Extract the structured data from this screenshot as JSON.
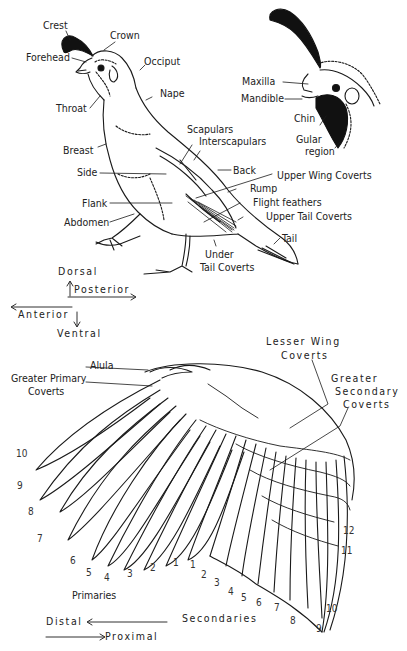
{
  "diagram": {
    "body_labels": {
      "crest": "Crest",
      "crown": "Crown",
      "forehead": "Forehead",
      "occiput": "Occiput",
      "throat": "Throat",
      "nape": "Nape",
      "breast": "Breast",
      "scapulars": "Scapulars",
      "interscapulars": "Interscapulars",
      "side": "Side",
      "back": "Back",
      "upper_wing_coverts": "Upper Wing Coverts",
      "rump": "Rump",
      "flank": "Flank",
      "flight_feathers": "Flight feathers",
      "upper_tail_coverts": "Upper Tail Coverts",
      "abdomen": "Abdomen",
      "tail": "Tail",
      "under_tail_coverts_1": "Under",
      "under_tail_coverts_2": "Tail Coverts"
    },
    "head_labels": {
      "maxilla": "Maxilla",
      "mandible": "Mandible",
      "chin": "Chin",
      "gular_1": "Gular",
      "gular_2": "region"
    },
    "orientation_body": {
      "dorsal": "Dorsal",
      "posterior": "Posterior",
      "anterior": "Anterior",
      "ventral": "Ventral"
    },
    "wing_labels": {
      "alula": "Alula",
      "greater_primary_coverts_1": "Greater Primary",
      "greater_primary_coverts_2": "Coverts",
      "lesser_wing_coverts_1": "Lesser Wing",
      "lesser_wing_coverts_2": "Coverts",
      "greater_secondary_coverts_1": "Greater",
      "greater_secondary_coverts_2": "Secondary",
      "greater_secondary_coverts_3": "Coverts",
      "primaries": "Primaries",
      "secondaries": "Secondaries"
    },
    "primary_numbers": [
      "10",
      "9",
      "8",
      "7",
      "6",
      "5",
      "4",
      "3",
      "2",
      "1"
    ],
    "secondary_numbers": [
      "1",
      "2",
      "3",
      "4",
      "5",
      "6",
      "7",
      "8",
      "9",
      "10",
      "11",
      "12"
    ],
    "orientation_wing": {
      "distal": "Distal",
      "proximal": "Proximal"
    },
    "colors": {
      "ink": "#1a1a1a",
      "paper": "#ffffff"
    }
  }
}
